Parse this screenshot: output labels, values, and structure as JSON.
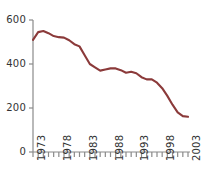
{
  "chart_data": {
    "type": "line",
    "title": "",
    "subtitle": "",
    "xlabel": "",
    "ylabel": "",
    "xlim": [
      1973,
      2003
    ],
    "ylim": [
      0,
      600
    ],
    "grid": false,
    "legend": false,
    "legend_position": "none",
    "line_color": "#8B3A3A",
    "axis_color": "#8a8a8a",
    "tick_color": "#555555",
    "y_ticks": [
      0,
      200,
      400,
      600
    ],
    "y_tick_labels": [
      "0",
      "200",
      "400",
      "600"
    ],
    "x_ticks": [
      1973,
      1974,
      1975,
      1976,
      1977,
      1978,
      1979,
      1980,
      1981,
      1982,
      1983,
      1984,
      1985,
      1986,
      1987,
      1988,
      1989,
      1990,
      1991,
      1992,
      1993,
      1994,
      1995,
      1996,
      1997,
      1998,
      1999,
      2000,
      2001,
      2002,
      2003
    ],
    "x_tick_labels": [
      "1973",
      "1978",
      "1983",
      "1988",
      "1993",
      "1998",
      "2003"
    ],
    "x_labelled_ticks": [
      1973,
      1978,
      1983,
      1988,
      1993,
      1998,
      2003
    ],
    "x": [
      1973,
      1974,
      1975,
      1976,
      1977,
      1978,
      1979,
      1980,
      1981,
      1982,
      1983,
      1984,
      1985,
      1986,
      1987,
      1988,
      1989,
      1990,
      1991,
      1992,
      1993,
      1994,
      1995,
      1996,
      1997,
      1998,
      1999,
      2000,
      2001,
      2002,
      2003
    ],
    "values": [
      510,
      545,
      550,
      540,
      527,
      522,
      520,
      508,
      490,
      480,
      440,
      400,
      385,
      370,
      375,
      380,
      380,
      372,
      360,
      365,
      358,
      340,
      330,
      330,
      315,
      290,
      255,
      215,
      180,
      163,
      160
    ],
    "series": [
      {
        "name": "value",
        "color": "#8B3A3A",
        "values": [
          510,
          545,
          550,
          540,
          527,
          522,
          520,
          508,
          490,
          480,
          440,
          400,
          385,
          370,
          375,
          380,
          380,
          372,
          360,
          365,
          358,
          340,
          330,
          330,
          315,
          290,
          255,
          215,
          180,
          163,
          160
        ]
      }
    ]
  },
  "layout": {
    "plot_left_px": 33,
    "plot_right_px": 188,
    "plot_top_px": 20,
    "plot_bottom_px": 152
  }
}
